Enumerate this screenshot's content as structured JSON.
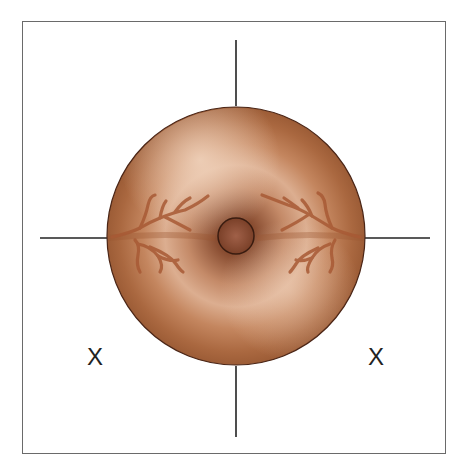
{
  "diagram": {
    "labels": {
      "left_marker": "X",
      "right_marker": "X"
    },
    "colors": {
      "frame": "#6a6a6a",
      "crosshair": "#222222",
      "cervix_outer": "#a8643e",
      "cervix_highlight": "#ecc7ab",
      "cervix_inner_shadow": "#7e4429",
      "os_fill": "#8a4e34",
      "os_outline": "#3a1c10",
      "vessels": "#a85a35"
    },
    "geometry": {
      "center": [
        236,
        236
      ],
      "cervix_radius": 129,
      "os_radius": 18,
      "crosshair": {
        "top": [
          236,
          40,
          236,
          106
        ],
        "bottom": [
          236,
          366,
          236,
          437
        ],
        "left": [
          40,
          238,
          107,
          238
        ],
        "right": [
          365,
          238,
          430,
          238
        ]
      }
    }
  }
}
